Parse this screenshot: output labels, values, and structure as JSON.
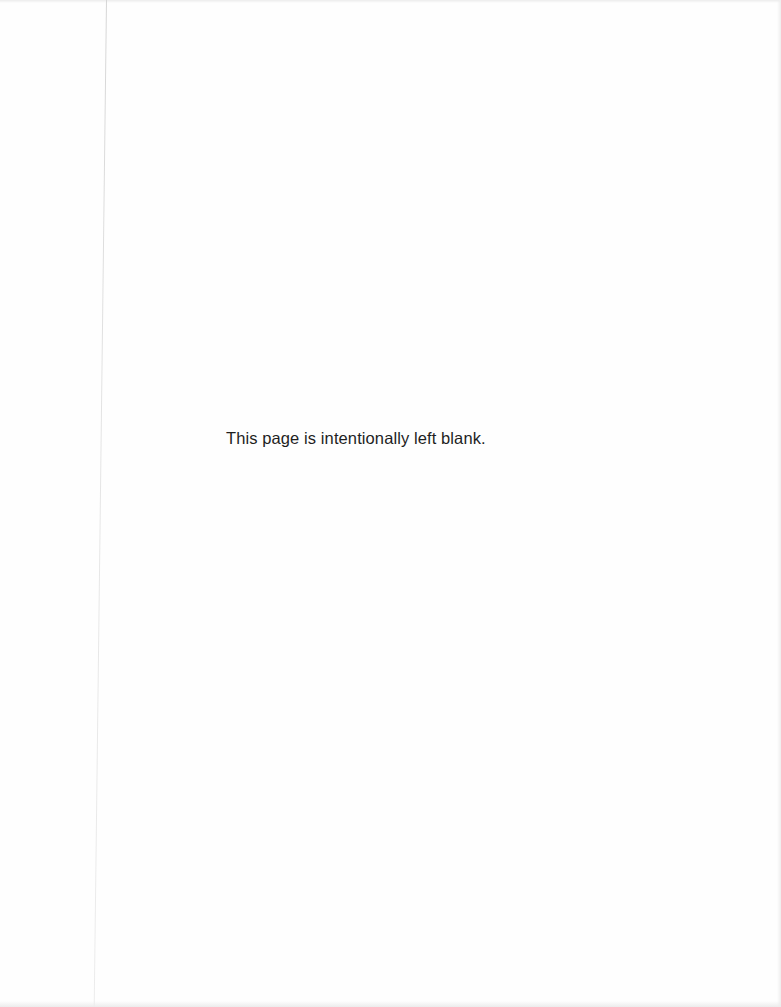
{
  "page": {
    "notice_text": "This page is intentionally left blank."
  },
  "colors": {
    "background": "#fefefe",
    "text": "#1e1e1e",
    "binding_line": "#d6d6d6"
  }
}
